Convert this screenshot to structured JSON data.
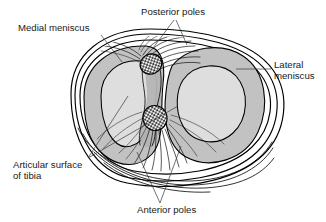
{
  "figure": {
    "kind": "anatomical-diagram",
    "background_color": "#ffffff",
    "colors": {
      "meniscus_fill": "#c2c2c2",
      "articular_surface_fill": "#dedede",
      "eminence_fill": "#b4b4b4",
      "stipple_fill": "#2b2b2b",
      "outline": "#000000",
      "leader_line": "#3a3a3a",
      "label_text": "#1a1a1a"
    },
    "labels": [
      {
        "id": "medial-meniscus",
        "lines": [
          "Medial meniscus"
        ],
        "x": 18,
        "y": 31,
        "anchor": "start"
      },
      {
        "id": "posterior-poles",
        "lines": [
          "Posterior poles"
        ],
        "x": 141,
        "y": 15,
        "anchor": "start"
      },
      {
        "id": "lateral-meniscus",
        "lines": [
          "Lateral",
          "meniscus"
        ],
        "x": 274,
        "y": 68,
        "anchor": "start"
      },
      {
        "id": "articular-surface-of-tibia",
        "lines": [
          "Articular surface",
          "of tibia"
        ],
        "x": 13,
        "y": 168,
        "anchor": "start"
      },
      {
        "id": "anterior-poles",
        "lines": [
          "Anterior poles"
        ],
        "x": 137,
        "y": 213,
        "anchor": "start"
      }
    ],
    "structures": [
      {
        "id": "medial-meniscus-ring",
        "name": "Medial meniscus",
        "side": "medial"
      },
      {
        "id": "lateral-meniscus-ring",
        "name": "Lateral meniscus",
        "side": "lateral"
      },
      {
        "id": "medial-articular-surface",
        "name": "Articular surface of tibia (medial)"
      },
      {
        "id": "lateral-articular-surface",
        "name": "Articular surface of tibia (lateral)"
      },
      {
        "id": "posterior-pole-stipple",
        "name": "Posterior poles"
      },
      {
        "id": "anterior-pole-stipple",
        "name": "Anterior poles"
      },
      {
        "id": "intercondylar-eminence",
        "name": "Intercondylar eminence"
      },
      {
        "id": "posterior-fiber-fan",
        "name": "Posterior capsular fibers"
      },
      {
        "id": "anterior-fiber-fan",
        "name": "Anterior capsular fibers"
      },
      {
        "id": "tibial-rim",
        "name": "Tibial plateau rim"
      }
    ]
  }
}
